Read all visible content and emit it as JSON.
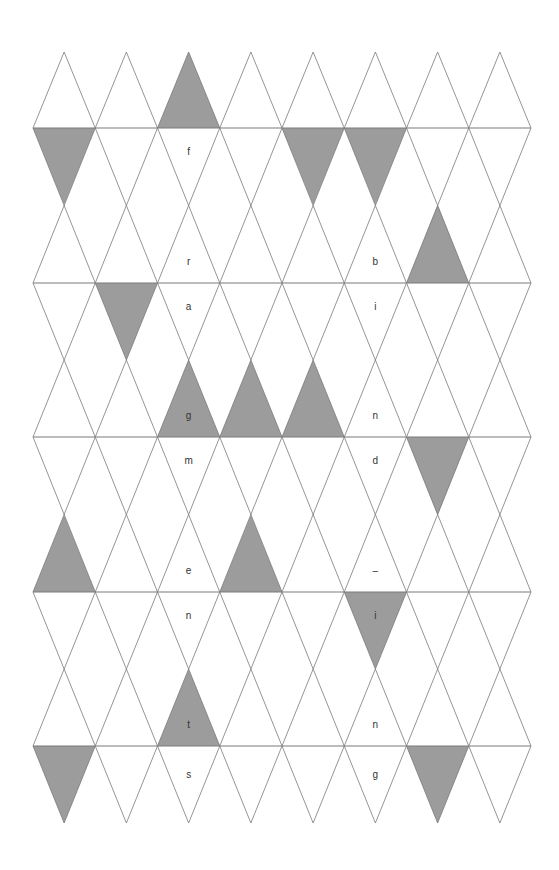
{
  "diagram": {
    "type": "triangular-grid-puzzle",
    "columns": 8,
    "bands": 6,
    "colors": {
      "fill": "#9c9c9c",
      "line": "#7a7a7a",
      "text": "#333333",
      "background": "#ffffff"
    },
    "filled_cells": [
      {
        "band": 0,
        "col": 2,
        "part": "bottom"
      },
      {
        "band": 1,
        "col": 0,
        "part": "top"
      },
      {
        "band": 1,
        "col": 4,
        "part": "top"
      },
      {
        "band": 1,
        "col": 5,
        "part": "top"
      },
      {
        "band": 1,
        "col": 6,
        "part": "bottom"
      },
      {
        "band": 2,
        "col": 1,
        "part": "top"
      },
      {
        "band": 2,
        "col": 2,
        "part": "bottom"
      },
      {
        "band": 2,
        "col": 3,
        "part": "bottom"
      },
      {
        "band": 2,
        "col": 4,
        "part": "bottom"
      },
      {
        "band": 3,
        "col": 6,
        "part": "top"
      },
      {
        "band": 3,
        "col": 0,
        "part": "bottom"
      },
      {
        "band": 3,
        "col": 3,
        "part": "bottom"
      },
      {
        "band": 4,
        "col": 5,
        "part": "top"
      },
      {
        "band": 4,
        "col": 2,
        "part": "bottom"
      },
      {
        "band": 5,
        "col": 0,
        "part": "top"
      },
      {
        "band": 5,
        "col": 6,
        "part": "top"
      }
    ],
    "letters": [
      {
        "band": 1,
        "col": 2,
        "part": "top",
        "text": "f"
      },
      {
        "band": 1,
        "col": 2,
        "part": "bottom",
        "text": "r"
      },
      {
        "band": 1,
        "col": 5,
        "part": "bottom",
        "text": "b"
      },
      {
        "band": 2,
        "col": 2,
        "part": "top",
        "text": "a"
      },
      {
        "band": 2,
        "col": 5,
        "part": "top",
        "text": "i"
      },
      {
        "band": 2,
        "col": 2,
        "part": "bottom",
        "text": "g"
      },
      {
        "band": 2,
        "col": 5,
        "part": "bottom",
        "text": "n"
      },
      {
        "band": 3,
        "col": 2,
        "part": "top",
        "text": "m"
      },
      {
        "band": 3,
        "col": 5,
        "part": "top",
        "text": "d"
      },
      {
        "band": 3,
        "col": 2,
        "part": "bottom",
        "text": "e"
      },
      {
        "band": 3,
        "col": 5,
        "part": "bottom",
        "text": "–"
      },
      {
        "band": 4,
        "col": 2,
        "part": "top",
        "text": "n"
      },
      {
        "band": 4,
        "col": 5,
        "part": "top",
        "text": "i"
      },
      {
        "band": 4,
        "col": 2,
        "part": "bottom",
        "text": "t"
      },
      {
        "band": 4,
        "col": 5,
        "part": "bottom",
        "text": "n"
      },
      {
        "band": 5,
        "col": 2,
        "part": "top",
        "text": "s"
      },
      {
        "band": 5,
        "col": 5,
        "part": "top",
        "text": "g"
      }
    ]
  }
}
